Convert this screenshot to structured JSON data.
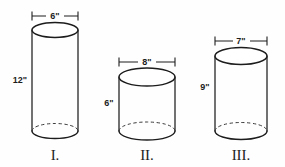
{
  "figure": {
    "background_color": "#fefefe",
    "line_color": "#1c1c1c",
    "hidden_edge_color": "#3a3a3a",
    "unit_symbol": "\"",
    "cylinders": [
      {
        "id": "cylinder-1",
        "numeral": "I.",
        "diameter_label": "6\"",
        "height_label": "12\"",
        "diameter_value": 6,
        "height_value": 12,
        "geometry": {
          "cx": 55,
          "left": 32,
          "right": 78,
          "top_y": 30,
          "bottom_y": 131,
          "rx": 23,
          "ry": 7.5
        },
        "dimension_line": {
          "y": 16,
          "x1": 32,
          "x2": 78,
          "label_x": 55,
          "label_y": 16
        },
        "height_label_pos": {
          "x": 20,
          "y": 81
        },
        "numeral_pos": {
          "x": 55,
          "y": 160
        }
      },
      {
        "id": "cylinder-2",
        "numeral": "II.",
        "diameter_label": "8\"",
        "height_label": "6\"",
        "diameter_value": 8,
        "height_value": 6,
        "geometry": {
          "cx": 147,
          "left": 119,
          "right": 175,
          "top_y": 77,
          "bottom_y": 131,
          "rx": 28,
          "ry": 9
        },
        "dimension_line": {
          "y": 62,
          "x1": 119,
          "x2": 175,
          "label_x": 147,
          "label_y": 62
        },
        "height_label_pos": {
          "x": 109,
          "y": 104
        },
        "numeral_pos": {
          "x": 147,
          "y": 160
        }
      },
      {
        "id": "cylinder-3",
        "numeral": "III.",
        "diameter_label": "7\"",
        "height_label": "9\"",
        "diameter_value": 7,
        "height_value": 9,
        "geometry": {
          "cx": 241,
          "left": 215,
          "right": 267,
          "top_y": 56,
          "bottom_y": 131,
          "rx": 26,
          "ry": 8.5
        },
        "dimension_line": {
          "y": 41,
          "x1": 215,
          "x2": 267,
          "label_x": 241,
          "label_y": 41
        },
        "height_label_pos": {
          "x": 205,
          "y": 88
        },
        "numeral_pos": {
          "x": 241,
          "y": 160
        }
      }
    ]
  }
}
